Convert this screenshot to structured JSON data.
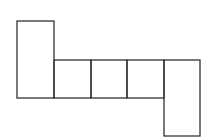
{
  "diagram": {
    "type": "box-net",
    "stroke_color": "#333333",
    "background": "#ffffff",
    "stroke_width": 1.3,
    "faces": [
      {
        "name": "face-left-tall",
        "x": 17,
        "y": 21,
        "w": 37,
        "h": 77
      },
      {
        "name": "face-middle-1",
        "x": 54,
        "y": 60,
        "w": 37,
        "h": 38
      },
      {
        "name": "face-middle-2",
        "x": 91,
        "y": 60,
        "w": 36,
        "h": 38
      },
      {
        "name": "face-middle-3",
        "x": 127,
        "y": 60,
        "w": 37,
        "h": 38
      },
      {
        "name": "face-right-tall",
        "x": 164,
        "y": 60,
        "w": 36,
        "h": 76
      }
    ]
  }
}
